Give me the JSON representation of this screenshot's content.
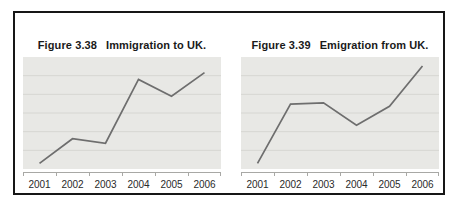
{
  "colors": {
    "frame_border": "#161616",
    "plot_background": "#e8e8e5",
    "gridline": "#d6d6d2",
    "line": "#6e6e6e",
    "axis": "#a8a8a5",
    "title_text": "#1a1a1a",
    "label_text": "#2a2a2a"
  },
  "chart_data": [
    {
      "type": "line",
      "figure_label": "Figure 3.38",
      "title": "Immigration to UK.",
      "categories": [
        "2001",
        "2002",
        "2003",
        "2004",
        "2005",
        "2006"
      ],
      "values": [
        5,
        27,
        23,
        80,
        65,
        86
      ],
      "xlabel": "",
      "ylabel": "",
      "ylim": [
        0,
        100
      ],
      "gridlines": 5,
      "grid": "horizontal",
      "legend": "none"
    },
    {
      "type": "line",
      "figure_label": "Figure 3.39",
      "title": "Emigration from UK.",
      "categories": [
        "2001",
        "2002",
        "2003",
        "2004",
        "2005",
        "2006"
      ],
      "values": [
        5,
        58,
        59,
        39,
        56,
        92
      ],
      "xlabel": "",
      "ylabel": "",
      "ylim": [
        0,
        100
      ],
      "gridlines": 5,
      "grid": "horizontal",
      "legend": "none"
    }
  ]
}
